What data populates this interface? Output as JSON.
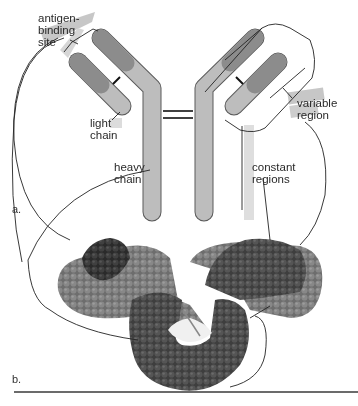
{
  "figure": {
    "panels": [
      {
        "id": "a",
        "label": "a.",
        "content": "schematic antibody (Y-shaped) diagram"
      },
      {
        "id": "b",
        "label": "b.",
        "content": "space-filling molecular model of antibody"
      }
    ],
    "labels": {
      "antigen_binding_site": "antigen-\nbinding\nsite",
      "light_chain": "light\nchain",
      "heavy_chain": "heavy\nchain",
      "variable_region": "variable\nregion",
      "constant_regions": "constant\nregions"
    },
    "colors": {
      "variable_dark": "#8c8c8c",
      "constant_light": "#bdbdbd",
      "outline": "#5a5a5a",
      "model_dark": "#3c3c3c",
      "model_mid": "#7a7a7a",
      "leader_line": "#222222",
      "highlight": "#b0b0b0"
    }
  }
}
